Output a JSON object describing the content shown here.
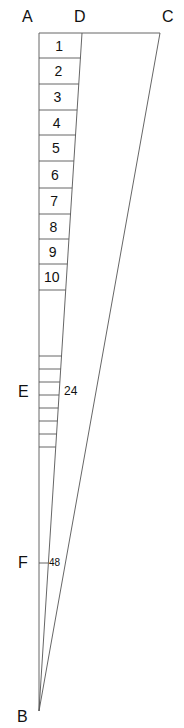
{
  "points": {
    "A": "A",
    "B": "B",
    "C": "C",
    "D": "D",
    "E": "E",
    "F": "F"
  },
  "cells": [
    "1",
    "2",
    "3",
    "4",
    "5",
    "6",
    "7",
    "8",
    "9",
    "10"
  ],
  "marks": {
    "E_value": "24",
    "F_value": "48"
  },
  "small_tick_count": 7
}
